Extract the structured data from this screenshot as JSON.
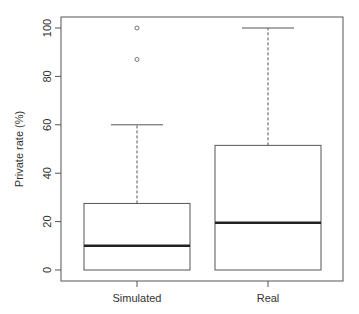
{
  "chart_data": {
    "type": "boxplot",
    "title": "",
    "xlabel": "",
    "ylabel": "Private rate (%)",
    "ylim": [
      0,
      100
    ],
    "yticks": [
      0,
      20,
      40,
      60,
      80,
      100
    ],
    "ytick_labels": [
      "0",
      "20",
      "40",
      "60",
      "80",
      "100"
    ],
    "categories": [
      "Simulated",
      "Real"
    ],
    "grid": false,
    "legend": null,
    "series": [
      {
        "name": "Simulated",
        "whisker_low": 0,
        "q1": 0,
        "median": 10,
        "q3": 27.5,
        "whisker_high": 60,
        "outliers": [
          87,
          100
        ]
      },
      {
        "name": "Real",
        "whisker_low": 0,
        "q1": 0,
        "median": 19.5,
        "q3": 51.5,
        "whisker_high": 100,
        "outliers": []
      }
    ]
  },
  "colors": {
    "frame": "#555555",
    "box": "#555555",
    "median": "#222222",
    "text": "#333333"
  }
}
